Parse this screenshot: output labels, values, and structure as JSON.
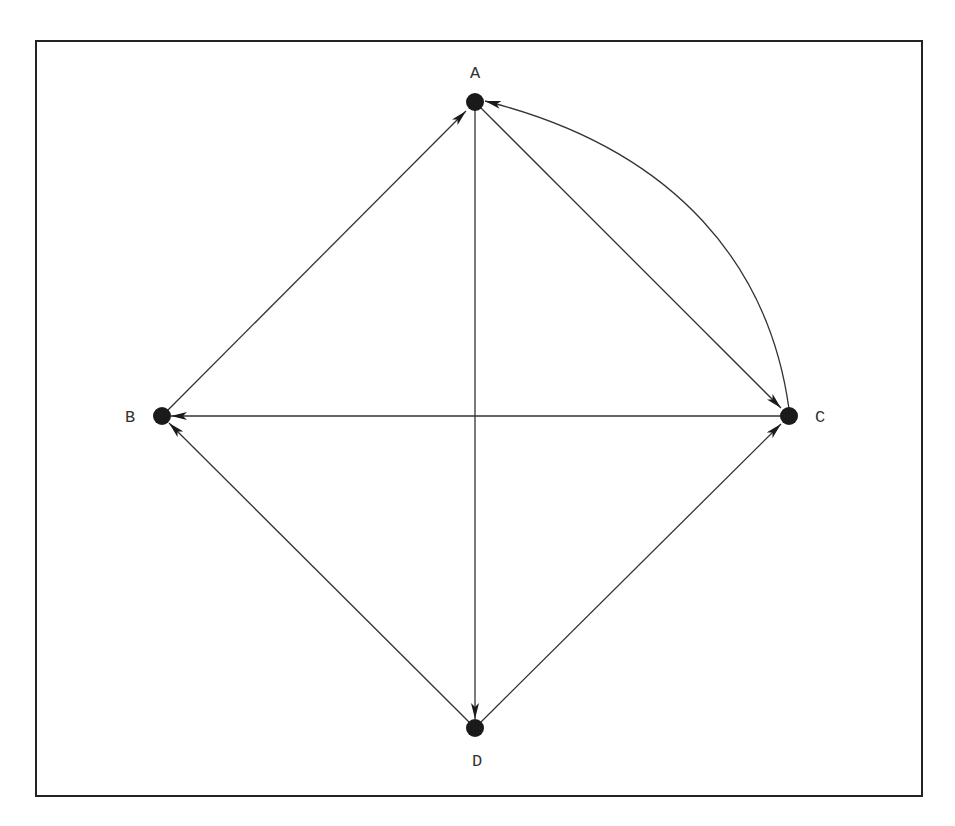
{
  "diagram": {
    "type": "directed-graph",
    "nodes": [
      {
        "id": "A",
        "label": "A",
        "x": 475,
        "y": 102,
        "label_x": 475,
        "label_y": 78
      },
      {
        "id": "B",
        "label": "B",
        "x": 162,
        "y": 416,
        "label_x": 130,
        "label_y": 422
      },
      {
        "id": "C",
        "label": "C",
        "x": 789,
        "y": 416,
        "label_x": 820,
        "label_y": 422
      },
      {
        "id": "D",
        "label": "D",
        "x": 475,
        "y": 728,
        "label_x": 477,
        "label_y": 766
      }
    ],
    "edges": [
      {
        "from": "B",
        "to": "A",
        "curved": false
      },
      {
        "from": "A",
        "to": "C",
        "curved": false
      },
      {
        "from": "C",
        "to": "A",
        "curved": true
      },
      {
        "from": "C",
        "to": "B",
        "curved": false
      },
      {
        "from": "A",
        "to": "D",
        "curved": false
      },
      {
        "from": "D",
        "to": "B",
        "curved": false
      },
      {
        "from": "D",
        "to": "C",
        "curved": false
      }
    ],
    "colors": {
      "node": "#1a1a1a",
      "edge": "#333333",
      "border": "#222222"
    }
  }
}
